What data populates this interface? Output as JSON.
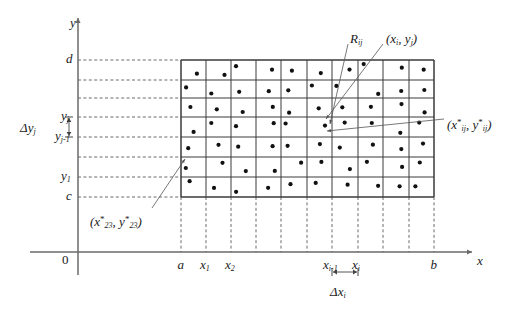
{
  "figure": {
    "type": "math-diagram",
    "background_color": "#ffffff",
    "line_color": "#3a3a3a",
    "dot_color": "#111111"
  },
  "axes": {
    "y_axis_label": "y",
    "x_axis_label": "x",
    "origin_label": "0",
    "x_axis_y_px": 252,
    "y_axis_x_px": 78,
    "x_axis_start_px": 30,
    "x_axis_end_px": 472,
    "y_axis_top_px": 18,
    "y_axis_bottom_px": 275
  },
  "x_ticks": [
    {
      "label": "a",
      "sub": "",
      "x_px": 181
    },
    {
      "label": "x",
      "sub": "1",
      "x_px": 206
    },
    {
      "label": "x",
      "sub": "2",
      "x_px": 231
    },
    {
      "label": "x",
      "sub": "i-1",
      "x_px": 332
    },
    {
      "label": "x",
      "sub": "i",
      "x_px": 358
    },
    {
      "label": "b",
      "sub": "",
      "x_px": 434
    }
  ],
  "y_ticks": [
    {
      "label": "d",
      "sub": "",
      "y_px": 60
    },
    {
      "label": "y",
      "sub": "j",
      "y_px": 117
    },
    {
      "label": "y",
      "sub": "j-1",
      "y_px": 137
    },
    {
      "label": "y",
      "sub": "1",
      "y_px": 177
    },
    {
      "label": "c",
      "sub": "",
      "y_px": 197
    }
  ],
  "grid": {
    "left_px": 181,
    "right_px": 434,
    "top_px": 60,
    "bottom_px": 197,
    "columns": 10,
    "rows": 7,
    "column_edges_px": [
      181,
      206,
      231,
      256,
      281,
      307,
      332,
      358,
      383,
      409,
      434
    ],
    "row_edges_px": [
      60,
      80,
      98,
      117,
      137,
      157,
      177,
      197
    ],
    "vertical_dash_bottom_px": 252,
    "horizontal_dash_left_px": 78
  },
  "annotations": {
    "region_label": {
      "base": "R",
      "sub": "ij",
      "x_px": 350,
      "y_px": 32
    },
    "sample_point_label": {
      "text_open": "(",
      "x_base": "x",
      "x_sub": "i",
      "comma": ", ",
      "y_base": "y",
      "y_sub": "j",
      "text_close": ")",
      "x_px": 386,
      "y_px": 32
    },
    "starred_point_right": {
      "text_open": "(",
      "x_base": "x",
      "x_sub": "ij",
      "x_star": "*",
      "comma": ", ",
      "y_base": "y",
      "y_sub": "ij",
      "y_star": "*",
      "text_close": ")",
      "x_px": 447,
      "y_px": 118
    },
    "starred_point_left": {
      "text_open": "(",
      "x_base": "x",
      "x_sub": "23",
      "x_star": "*",
      "comma": ", ",
      "y_base": "y",
      "y_sub": "23",
      "y_star": "*",
      "text_close": ")",
      "x_px": 90,
      "y_px": 215
    },
    "delta_x": {
      "delta": "Δ",
      "base": "x",
      "sub": "i",
      "x_px": 330,
      "y_px": 285,
      "bracket_left_px": 332,
      "bracket_right_px": 358,
      "bracket_y_px": 272
    },
    "delta_y": {
      "delta": "Δ",
      "base": "y",
      "sub": "j",
      "x_px": 20,
      "y_px": 121,
      "bracket_top_px": 117,
      "bracket_bottom_px": 137,
      "bracket_x_px": 69
    }
  },
  "leader_lines": [
    {
      "name": "region-leader",
      "from_x": 348,
      "from_y": 44,
      "to_x": 330,
      "to_y": 124
    },
    {
      "name": "sample-point-leader",
      "from_x": 383,
      "from_y": 44,
      "to_x": 326,
      "to_y": 119
    },
    {
      "name": "starred-right-leader",
      "from_x": 444,
      "from_y": 119,
      "to_x": 327,
      "to_y": 131
    },
    {
      "name": "starred-left-leader",
      "from_x": 152,
      "from_y": 208,
      "to_x": 185,
      "to_y": 159
    }
  ],
  "dots": {
    "count": 70,
    "radius_px": 2.1,
    "description": "one sample point inside each of the 70 subrectangles"
  }
}
